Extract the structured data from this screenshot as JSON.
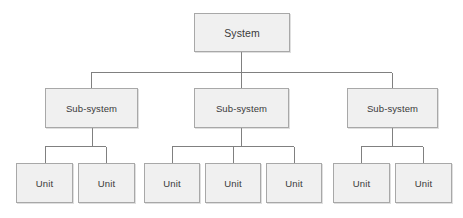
{
  "diagram": {
    "canvas": {
      "width": 463,
      "height": 218,
      "background": "#ffffff"
    },
    "style": {
      "box_fill": "#f0f0f0",
      "box_border": "#a8a8a8",
      "connector_color": "#808080",
      "text_color": "#3a3a3a"
    },
    "levels": [
      {
        "name": "system",
        "label": "System"
      },
      {
        "name": "subsystem",
        "label": "Sub-system"
      },
      {
        "name": "unit",
        "label": "Unit"
      }
    ],
    "nodes": {
      "system": {
        "label": "System",
        "x": 194,
        "y": 13,
        "w": 96,
        "h": 39
      },
      "subsystems": [
        {
          "label": "Sub-system",
          "x": 45,
          "y": 88,
          "w": 93,
          "h": 40
        },
        {
          "label": "Sub-system",
          "x": 194,
          "y": 88,
          "w": 95,
          "h": 40
        },
        {
          "label": "Sub-system",
          "x": 347,
          "y": 88,
          "w": 91,
          "h": 40
        }
      ],
      "units": [
        {
          "label": "Unit",
          "x": 16,
          "y": 163,
          "w": 57,
          "h": 40,
          "group": 0
        },
        {
          "label": "Unit",
          "x": 78,
          "y": 163,
          "w": 57,
          "h": 40,
          "group": 0
        },
        {
          "label": "Unit",
          "x": 144,
          "y": 163,
          "w": 56,
          "h": 40,
          "group": 1
        },
        {
          "label": "Unit",
          "x": 205,
          "y": 163,
          "w": 56,
          "h": 40,
          "group": 1
        },
        {
          "label": "Unit",
          "x": 266,
          "y": 163,
          "w": 56,
          "h": 40,
          "group": 1
        },
        {
          "label": "Unit",
          "x": 333,
          "y": 163,
          "w": 57,
          "h": 40,
          "group": 2
        },
        {
          "label": "Unit",
          "x": 395,
          "y": 163,
          "w": 57,
          "h": 40,
          "group": 2
        }
      ]
    },
    "connectors": {
      "system_stem": {
        "x": 241,
        "y1": 52,
        "y2": 72
      },
      "level1_bus": {
        "y": 72,
        "x1": 91,
        "x2": 392
      },
      "level1_drops": [
        {
          "x": 91,
          "y1": 72,
          "y2": 88
        },
        {
          "x": 241,
          "y1": 72,
          "y2": 88
        },
        {
          "x": 392,
          "y1": 72,
          "y2": 88
        }
      ],
      "group_stems": [
        {
          "x": 92,
          "y1": 128,
          "y2": 146
        },
        {
          "x": 241,
          "y1": 128,
          "y2": 146
        },
        {
          "x": 392,
          "y1": 128,
          "y2": 146
        }
      ],
      "group_buses": [
        {
          "y": 146,
          "x1": 45,
          "x2": 106
        },
        {
          "y": 146,
          "x1": 172,
          "x2": 294
        },
        {
          "y": 146,
          "x1": 361,
          "x2": 423
        }
      ],
      "unit_drops": [
        {
          "x": 45,
          "y1": 146,
          "y2": 163
        },
        {
          "x": 106,
          "y1": 146,
          "y2": 163
        },
        {
          "x": 172,
          "y1": 146,
          "y2": 163
        },
        {
          "x": 233,
          "y1": 146,
          "y2": 163
        },
        {
          "x": 294,
          "y1": 146,
          "y2": 163
        },
        {
          "x": 361,
          "y1": 146,
          "y2": 163
        },
        {
          "x": 423,
          "y1": 146,
          "y2": 163
        }
      ]
    }
  }
}
